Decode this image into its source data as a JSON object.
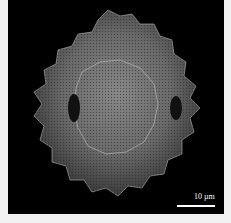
{
  "image": {
    "subject": "SEM micrograph of echinate pollen grain",
    "background_color": "#000000",
    "border_color": "#f2f2f2"
  },
  "scale_bar": {
    "label": "10 µm",
    "color": "#ffffff"
  }
}
